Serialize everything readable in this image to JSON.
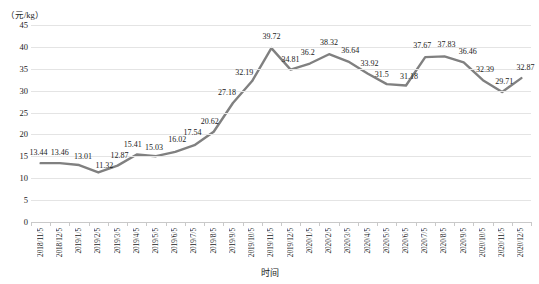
{
  "chart_data": {
    "type": "line",
    "title": "",
    "xlabel": "时间",
    "ylabel": "（元/kg）",
    "ylim": [
      0,
      45
    ],
    "ytick_step": 5,
    "yticks": [
      0,
      5,
      10,
      15,
      20,
      25,
      30,
      35,
      40,
      45
    ],
    "grid": true,
    "legend": "none",
    "line_color": "#808080",
    "categories": [
      "2018/11/5",
      "2018/12/5",
      "2019/1/5",
      "2019/2/5",
      "2019/3/5",
      "2019/4/5",
      "2019/5/5",
      "2019/6/5",
      "2019/7/5",
      "2019/8/5",
      "2019/9/5",
      "2019/10/5",
      "2019/11/5",
      "2019/12/5",
      "2020/1/5",
      "2020/2/5",
      "2020/3/5",
      "2020/4/5",
      "2020/5/5",
      "2020/6/5",
      "2020/7/5",
      "2020/8/5",
      "2020/9/5",
      "2020/10/5",
      "2020/11/5",
      "2020/12/5"
    ],
    "values": [
      13.44,
      13.46,
      13.01,
      11.32,
      12.87,
      15.41,
      15.03,
      16.02,
      17.54,
      20.62,
      27.18,
      32.19,
      39.72,
      34.81,
      36.2,
      38.32,
      36.64,
      33.92,
      31.5,
      31.18,
      37.67,
      37.83,
      36.46,
      32.39,
      29.71,
      32.87
    ],
    "value_labels": [
      "13.44",
      "13.46",
      "13.01",
      "11.32",
      "12.87",
      "15.41",
      "15.03",
      "16.02",
      "17.54",
      "20.62",
      "27.18",
      "32.19",
      "39.72",
      "34.81",
      "36.2",
      "38.32",
      "36.64",
      "33.92",
      "31.5",
      "31.18",
      "37.67",
      "37.83",
      "36.46",
      "32.39",
      "29.71",
      "32.87"
    ]
  }
}
